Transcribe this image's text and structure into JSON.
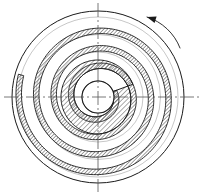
{
  "figure": {
    "type": "technical-line-drawing",
    "background_color": "#ffffff",
    "line_color": "#1a1a1a",
    "centerline_color": "#555555",
    "hatch_color": "#222222",
    "canvas": {
      "width": 204,
      "height": 195
    }
  },
  "geometry": {
    "center": {
      "x": 98,
      "y": 97
    },
    "outer_circle": {
      "label": "outer boundary circle",
      "radius": 86,
      "stroke_width": 1.0
    },
    "inner_hub_circle": {
      "label": "central bore",
      "radius": 16,
      "stroke_width": 1.1,
      "fill": "#ffffff"
    },
    "spiral": {
      "label": "hatched scroll wrap",
      "type": "archimedean",
      "turns": 3.6,
      "start_radius": 17,
      "end_radius": 80,
      "band_thickness": 5.5,
      "growth_per_turn": 17.5,
      "hatch_spacing": 2.6,
      "hatch_angle_deg": 45,
      "start_angle_deg": -20
    },
    "core_wedge": {
      "label": "solid hatched core",
      "outer_radius": 37,
      "hatch_spacing": 3.4,
      "hatch_angle_deg": 45
    },
    "centerlines": {
      "style": "dash-dot",
      "dash_pattern": "14 3 2 3",
      "stroke_width": 0.8,
      "horizontal": {
        "x1": 4,
        "y1": 97,
        "x2": 200,
        "y2": 97
      },
      "vertical": {
        "x1": 98,
        "y1": 3,
        "x2": 98,
        "y2": 192
      }
    },
    "rotation_arrow": {
      "label": "rotation direction arrow",
      "direction": "counter-clockwise",
      "arc_start": {
        "x": 180,
        "y": 48
      },
      "arc_end": {
        "x": 147,
        "y": 17
      },
      "arrowhead_at": "end",
      "stroke_width": 0.9
    }
  },
  "annotations": {
    "visible_text": []
  }
}
